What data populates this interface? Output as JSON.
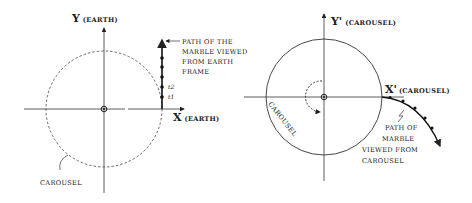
{
  "left_panel": {
    "y_axis_label_letter": "Y",
    "y_axis_label_frame": "(EARTH)",
    "x_axis_label_letter": "X",
    "x_axis_label_frame": "(EARTH)",
    "circle_label": "CAROUSEL",
    "path_annotation": [
      "PATH OF THE",
      "MARBLE VIEWED",
      "FROM EARTH",
      "FRAME"
    ],
    "time_labels": [
      "t2",
      "t1"
    ]
  },
  "right_panel": {
    "y_axis_label_letter": "Y'",
    "y_axis_label_frame": "(CAROUSEL)",
    "x_axis_label_letter": "X'",
    "x_axis_label_frame": "(CAROUSEL)",
    "circle_label": "CAROUSEL",
    "path_annotation": [
      "PATH OF",
      "MARBLE",
      "VIEWED FROM",
      "CAROUSEL"
    ]
  },
  "colors": {
    "ink": "#222222",
    "background": "#ffffff"
  }
}
